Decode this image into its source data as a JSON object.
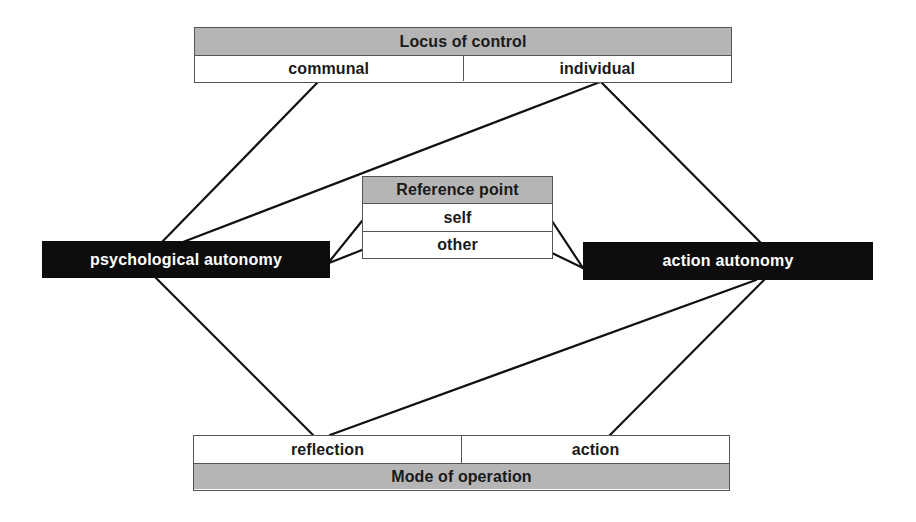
{
  "diagram": {
    "locus_of_control": {
      "title": "Locus of control",
      "options": [
        "communal",
        "individual"
      ]
    },
    "reference_point": {
      "title": "Reference point",
      "options": [
        "self",
        "other"
      ]
    },
    "mode_of_operation": {
      "title": "Mode of operation",
      "options": [
        "reflection",
        "action"
      ]
    },
    "nodes": {
      "psychological_autonomy": "psychological autonomy",
      "action_autonomy": "action autonomy"
    },
    "connections": [
      {
        "from": "communal",
        "to": "psychological autonomy"
      },
      {
        "from": "individual",
        "to": "psychological autonomy"
      },
      {
        "from": "individual",
        "to": "action autonomy"
      },
      {
        "from": "psychological autonomy",
        "to": "self"
      },
      {
        "from": "psychological autonomy",
        "to": "other"
      },
      {
        "from": "action autonomy",
        "to": "self"
      },
      {
        "from": "action autonomy",
        "to": "other"
      },
      {
        "from": "psychological autonomy",
        "to": "reflection"
      },
      {
        "from": "action autonomy",
        "to": "reflection"
      },
      {
        "from": "action autonomy",
        "to": "action"
      }
    ],
    "colors": {
      "header_fill": "#b5b5b5",
      "node_fill": "#0d0d0d",
      "node_text": "#ffffff",
      "line": "#111111",
      "border": "#555555"
    }
  }
}
